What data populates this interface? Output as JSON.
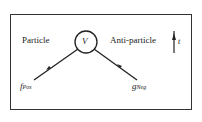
{
  "diagram": {
    "left_label": "Particle",
    "right_label": "Anti-particle",
    "vertex_label": "V",
    "left_leg_label": {
      "main": "f",
      "sub": "Pos"
    },
    "right_leg_label": {
      "main": "g",
      "sub": "Neg"
    },
    "time_axis_label": "t",
    "colors": {
      "line": "#222222",
      "background": "#ffffff"
    }
  }
}
